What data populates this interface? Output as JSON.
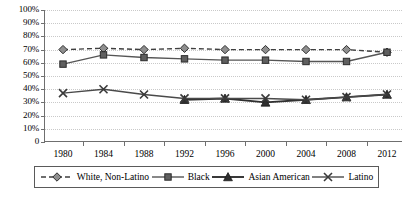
{
  "chart_data": {
    "type": "line",
    "title": "",
    "xlabel": "",
    "ylabel": "",
    "categories": [
      "1980",
      "1984",
      "1988",
      "1992",
      "1996",
      "2000",
      "2004",
      "2008",
      "2012"
    ],
    "x": [
      1980,
      1984,
      1988,
      1992,
      1996,
      2000,
      2004,
      2008,
      2012
    ],
    "ylim": [
      0,
      100
    ],
    "ytick_labels": [
      "0",
      "10%",
      "20%",
      "30%",
      "40%",
      "50%",
      "60%",
      "70%",
      "80%",
      "90%",
      "100%"
    ],
    "ytick_values": [
      0,
      10,
      20,
      30,
      40,
      50,
      60,
      70,
      80,
      90,
      100
    ],
    "grid": true,
    "legend_position": "bottom",
    "series": [
      {
        "name": "White, Non-Latino",
        "marker": "diamond",
        "line_style": "dashed",
        "color": "#3f3f3f",
        "values": [
          70,
          71,
          70,
          71,
          70,
          70,
          70,
          70,
          68
        ]
      },
      {
        "name": "Black",
        "marker": "square",
        "line_style": "solid",
        "color": "#555555",
        "values": [
          59,
          66,
          64,
          63,
          62,
          62,
          61,
          61,
          68
        ]
      },
      {
        "name": "Asian American",
        "marker": "triangle",
        "line_style": "solid",
        "color": "#2f2f2f",
        "values": [
          null,
          null,
          null,
          32,
          33,
          30,
          32,
          34,
          36
        ]
      },
      {
        "name": "Latino",
        "marker": "cross",
        "line_style": "solid",
        "color": "#4a4a4a",
        "values": [
          37,
          40,
          36,
          33,
          33,
          33,
          32,
          34,
          36
        ]
      }
    ]
  },
  "legend": {
    "items": [
      {
        "label": "White, Non-Latino"
      },
      {
        "label": "Black"
      },
      {
        "label": "Asian American"
      },
      {
        "label": "Latino"
      }
    ]
  }
}
